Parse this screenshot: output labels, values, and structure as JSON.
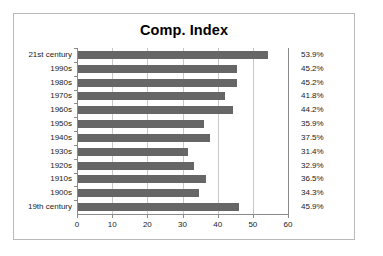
{
  "chart_data": {
    "type": "bar",
    "orientation": "horizontal",
    "title": "Comp. Index",
    "xlabel": "",
    "ylabel": "",
    "xlim": [
      0,
      60
    ],
    "xticks": [
      0,
      10,
      20,
      30,
      40,
      50,
      60
    ],
    "xtick_labels": [
      "0",
      "10",
      "20",
      "30",
      "40",
      "50",
      "60"
    ],
    "grid": true,
    "legend": "none",
    "bar_color": "#666666",
    "categories": [
      "21st century",
      "1990s",
      "1980s",
      "1970s",
      "1960s",
      "1950s",
      "1940s",
      "1930s",
      "1920s",
      "1910s",
      "1900s",
      "19th century"
    ],
    "values": [
      53.9,
      45.2,
      45.2,
      41.8,
      44.2,
      35.9,
      37.5,
      31.4,
      32.9,
      36.5,
      34.3,
      45.9
    ],
    "data_labels": [
      "53.9%",
      "45.2%",
      "45.2%",
      "41.8%",
      "44.2%",
      "35.9%",
      "37.5%",
      "31.4%",
      "32.9%",
      "36.5%",
      "34.3%",
      "45.9%"
    ]
  }
}
